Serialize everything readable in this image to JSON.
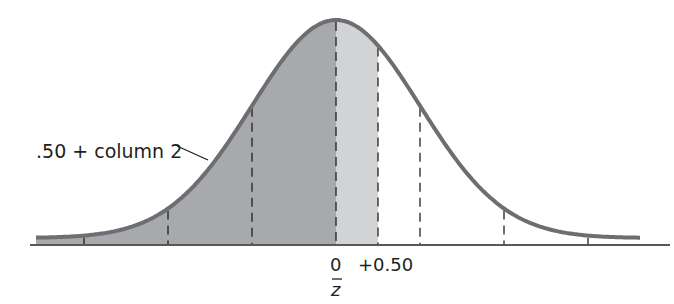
{
  "figure": {
    "type": "normal-distribution-diagram",
    "annotation": ".50 + column 2",
    "x_labels": {
      "zero": "0",
      "plus_half": "+0.50",
      "axis_symbol": "z̄"
    },
    "colors": {
      "curve": "#6d6e71",
      "shade_dark": "#a7a9ac",
      "shade_light": "#d1d3d4",
      "dashes": "#231f20",
      "axis": "#231f20",
      "background": "#ffffff"
    }
  },
  "chart_data": {
    "type": "area",
    "title": "",
    "xlabel": "z",
    "ylabel": "",
    "tick_labels": [
      "0",
      "+0.50"
    ],
    "shaded_region": {
      "from": "-inf",
      "to": 0.5,
      "dark_to": 0,
      "light_from": 0,
      "light_to": 0.5
    },
    "dashed_lines_z": [
      -3,
      -2,
      -1,
      0,
      0.5,
      1,
      2,
      3
    ],
    "annotation": ".50 + column 2",
    "grid": false,
    "legend": "none"
  }
}
